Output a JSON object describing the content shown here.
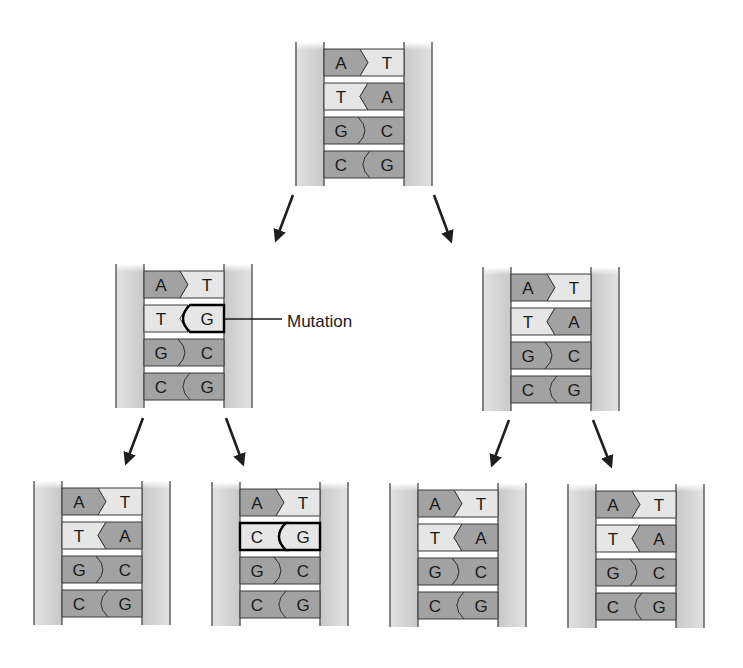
{
  "colors": {
    "backbone_fill": "#d4d4d4",
    "backbone_line": "#555555",
    "dark_base": "#a2a2a2",
    "light_base": "#e6e6e6",
    "outline": "#3a3a3a",
    "mutation_outline": "#000000",
    "arrow": "#1e1e1e",
    "text": "#1a1a1a"
  },
  "annotation": {
    "label": "Mutation"
  },
  "strands": [
    {
      "id": "parent",
      "name": "parent-dna",
      "x": 296,
      "y": 42,
      "height": 144,
      "pairs": [
        {
          "left": "A",
          "right": "T",
          "mutated": false
        },
        {
          "left": "T",
          "right": "A",
          "mutated": false
        },
        {
          "left": "G",
          "right": "C",
          "mutated": false
        },
        {
          "left": "C",
          "right": "G",
          "mutated": false
        }
      ]
    },
    {
      "id": "gen1_left",
      "name": "mutated-daughter-dna",
      "x": 116,
      "y": 264,
      "height": 144,
      "pairs": [
        {
          "left": "A",
          "right": "T",
          "mutated": false
        },
        {
          "left": "T",
          "right": "G",
          "mutated": true,
          "mutated_side": "right"
        },
        {
          "left": "G",
          "right": "C",
          "mutated": false
        },
        {
          "left": "C",
          "right": "G",
          "mutated": false
        }
      ]
    },
    {
      "id": "gen1_right",
      "name": "normal-daughter-dna",
      "x": 483,
      "y": 267,
      "height": 144,
      "pairs": [
        {
          "left": "A",
          "right": "T",
          "mutated": false
        },
        {
          "left": "T",
          "right": "A",
          "mutated": false
        },
        {
          "left": "G",
          "right": "C",
          "mutated": false
        },
        {
          "left": "C",
          "right": "G",
          "mutated": false
        }
      ]
    },
    {
      "id": "gen2_1",
      "name": "granddaughter-dna-1",
      "x": 34,
      "y": 481,
      "height": 144,
      "pairs": [
        {
          "left": "A",
          "right": "T",
          "mutated": false
        },
        {
          "left": "T",
          "right": "A",
          "mutated": false
        },
        {
          "left": "G",
          "right": "C",
          "mutated": false
        },
        {
          "left": "C",
          "right": "G",
          "mutated": false
        }
      ]
    },
    {
      "id": "gen2_2",
      "name": "granddaughter-dna-2-mutant",
      "x": 212,
      "y": 482,
      "height": 144,
      "pairs": [
        {
          "left": "A",
          "right": "T",
          "mutated": false
        },
        {
          "left": "C",
          "right": "G",
          "mutated": true,
          "mutated_side": "both"
        },
        {
          "left": "G",
          "right": "C",
          "mutated": false
        },
        {
          "left": "C",
          "right": "G",
          "mutated": false
        }
      ]
    },
    {
      "id": "gen2_3",
      "name": "granddaughter-dna-3",
      "x": 390,
      "y": 483,
      "height": 144,
      "pairs": [
        {
          "left": "A",
          "right": "T",
          "mutated": false
        },
        {
          "left": "T",
          "right": "A",
          "mutated": false
        },
        {
          "left": "G",
          "right": "C",
          "mutated": false
        },
        {
          "left": "C",
          "right": "G",
          "mutated": false
        }
      ]
    },
    {
      "id": "gen2_4",
      "name": "granddaughter-dna-4",
      "x": 568,
      "y": 484,
      "height": 144,
      "pairs": [
        {
          "left": "A",
          "right": "T",
          "mutated": false
        },
        {
          "left": "T",
          "right": "A",
          "mutated": false
        },
        {
          "left": "G",
          "right": "C",
          "mutated": false
        },
        {
          "left": "C",
          "right": "G",
          "mutated": false
        }
      ]
    }
  ],
  "arrows": [
    {
      "name": "arrow-parent-to-left",
      "x1": 293,
      "y1": 195,
      "x2": 276,
      "y2": 240
    },
    {
      "name": "arrow-parent-to-right",
      "x1": 434,
      "y1": 195,
      "x2": 451,
      "y2": 241
    },
    {
      "name": "arrow-left-to-gen2-1",
      "x1": 143,
      "y1": 418,
      "x2": 126,
      "y2": 463
    },
    {
      "name": "arrow-left-to-gen2-2",
      "x1": 226,
      "y1": 418,
      "x2": 243,
      "y2": 464
    },
    {
      "name": "arrow-right-to-gen2-3",
      "x1": 509,
      "y1": 420,
      "x2": 492,
      "y2": 465
    },
    {
      "name": "arrow-right-to-gen2-4",
      "x1": 593,
      "y1": 420,
      "x2": 611,
      "y2": 466
    }
  ],
  "footer_rule": {
    "x1": 33,
    "x2": 300,
    "y": 665
  }
}
